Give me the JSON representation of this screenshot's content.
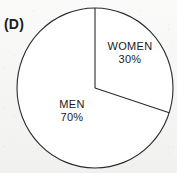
{
  "figure": {
    "panel_label": "(D)",
    "background_color": "#f4f4f3",
    "stroke_color": "#2b2b2b",
    "fill_color": "#ffffff"
  },
  "chart_data": {
    "type": "pie",
    "title": "(D)",
    "categories": [
      "WOMEN",
      "MEN"
    ],
    "values": [
      30,
      70
    ],
    "value_unit": "%",
    "labels": [
      "30%",
      "70%"
    ],
    "start_angle_deg": 0,
    "direction": "clockwise",
    "legend": "none",
    "grid": false,
    "slices": [
      {
        "name": "WOMEN",
        "value": 30,
        "value_label": "30%",
        "start_angle_deg": 0,
        "end_angle_deg": 108,
        "color": "#ffffff"
      },
      {
        "name": "MEN",
        "value": 70,
        "value_label": "70%",
        "start_angle_deg": 108,
        "end_angle_deg": 360,
        "color": "#ffffff"
      }
    ],
    "geometry": {
      "center_x": 95,
      "center_y": 88,
      "radius_x": 78,
      "radius_y": 80
    }
  }
}
